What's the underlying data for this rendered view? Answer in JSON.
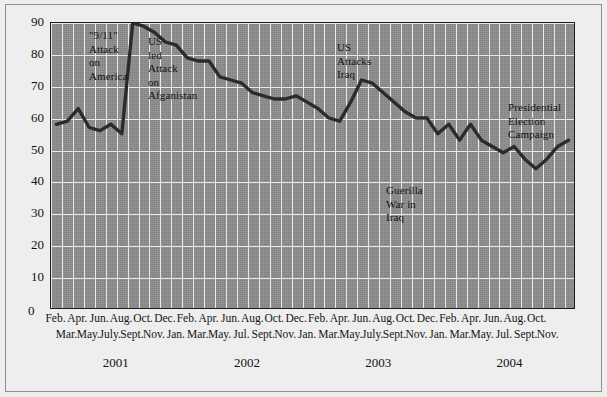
{
  "chart_data": {
    "type": "line",
    "title": "",
    "xlabel": "",
    "ylabel": "",
    "ylim": [
      0,
      90
    ],
    "yticks": [
      0,
      10,
      20,
      30,
      40,
      50,
      60,
      70,
      80,
      90
    ],
    "grid": true,
    "legend": "none",
    "series": [
      {
        "name": "Approval rating",
        "values": [
          58,
          59,
          63,
          57,
          56,
          58,
          55,
          90,
          89,
          87,
          84,
          83,
          79,
          78,
          78,
          73,
          72,
          71,
          68,
          67,
          66,
          66,
          67,
          65,
          63,
          60,
          59,
          65,
          72,
          71,
          68,
          65,
          62,
          60,
          60,
          55,
          58,
          53,
          58,
          53,
          51,
          49,
          51,
          47,
          44,
          47,
          51,
          53
        ]
      }
    ],
    "x": [
      "Feb 2001",
      "Mar 2001",
      "Apr 2001",
      "May 2001",
      "Jun 2001",
      "July 2001",
      "Aug 2001",
      "Sept 2001",
      "Oct 2001",
      "Nov 2001",
      "Dec 2001",
      "Jan 2002",
      "Feb 2002",
      "Mar 2002",
      "Apr 2002",
      "May 2002",
      "Jun 2002",
      "Jul 2002",
      "Aug 2002",
      "Sept 2002",
      "Oct 2002",
      "Nov 2002",
      "Dec 2002",
      "Jan 2003",
      "Feb 2003",
      "Mar 2003",
      "Apr 2003",
      "May 2003",
      "Jun 2003",
      "July 2003",
      "Aug 2003",
      "Sept 2003",
      "Oct 2003",
      "Nov 2003",
      "Dec 2003",
      "Jan 2004",
      "Feb 2004",
      "Mar 2004",
      "Apr 2004",
      "May 2004",
      "Jun 2004",
      "Jul 2004",
      "Aug 2004",
      "Sept 2004",
      "Oct 2004",
      "Nov 2004",
      "Dec 2004",
      "Jan 2005"
    ],
    "annotations": [
      {
        "text": "\"9/11\"\nAttack\non\nAmerica",
        "x_px": 88,
        "y_px": 28
      },
      {
        "text": "US\nled\nAttack\non\nAfganistan",
        "x_px": 147,
        "y_px": 34
      },
      {
        "text": "US\nAttacks\nIraq",
        "x_px": 336,
        "y_px": 40
      },
      {
        "text": "Guerilla\nWar in\nIraq",
        "x_px": 385,
        "y_px": 183
      },
      {
        "text": "Presidential\nElection\nCampaign",
        "x_px": 507,
        "y_px": 100
      }
    ]
  },
  "yaxis": {
    "labels": [
      "90",
      "80",
      "70",
      "60",
      "50",
      "40",
      "30",
      "20",
      "10"
    ],
    "zero_label": "0"
  },
  "xaxis": {
    "row_a": [
      "Feb.",
      "Apr.",
      "Jun.",
      "Aug.",
      "Oct.",
      "Dec.",
      "Feb.",
      "Apr.",
      "Jun.",
      "Aug.",
      "Oct.",
      "Dec.",
      "Feb.",
      "Apr.",
      "Jun.",
      "Aug.",
      "Oct.",
      "Dec.",
      "Feb.",
      "Apr.",
      "Jun.",
      "Aug.",
      "Oct."
    ],
    "row_b": [
      "Mar.",
      "May.",
      "July.",
      "Sept.",
      "Nov.",
      "Jan.",
      "Mar.",
      "May.",
      "Jul.",
      "Sept.",
      "Nov.",
      "Jan.",
      "Mar.",
      "May.",
      "July.",
      "Sept.",
      "Nov.",
      "Jan.",
      "Mar.",
      "May.",
      "Jul.",
      "Sept.",
      "Nov."
    ]
  },
  "years": [
    "2001",
    "2002",
    "2003",
    "2004"
  ],
  "colors": {
    "plot_background": "#8d8d8d",
    "grid": "#e9e9e9",
    "line": "#2b2b2b",
    "page_background": "#eeeeee",
    "text": "#111111"
  }
}
